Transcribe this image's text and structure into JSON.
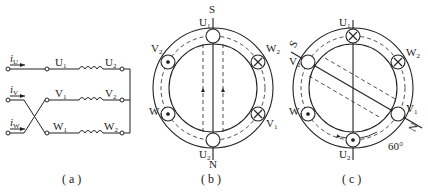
{
  "figure_a": {
    "caption": "( a )",
    "currents": [
      "i",
      "i",
      "i"
    ],
    "current_subs": [
      "U",
      "V",
      "W"
    ],
    "start_labels": [
      "U",
      "V",
      "W"
    ],
    "end_labels": [
      "U",
      "V",
      "W"
    ],
    "sub1": "1",
    "sub2": "2"
  },
  "figure_b": {
    "caption": "( b )",
    "pole_top": "S",
    "pole_bottom": "N",
    "labels": {
      "U1": "U",
      "U2": "U",
      "V1": "V",
      "V2": "V",
      "W1": "W",
      "W2": "W"
    }
  },
  "figure_c": {
    "caption": "( c )",
    "pole_s": "S",
    "pole_n": "N",
    "angle": "60°",
    "labels": {
      "U1": "U",
      "U2": "U",
      "V1": "V",
      "V2": "V",
      "W1": "W",
      "W2": "W"
    }
  },
  "colors": {
    "line": "#222222",
    "background": "#ffffff"
  }
}
